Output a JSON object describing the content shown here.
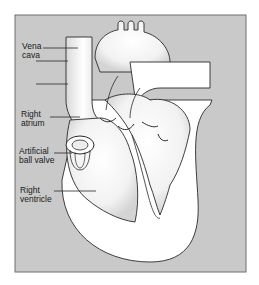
{
  "diagram": {
    "colors": {
      "panel": "#c9c9c9",
      "panel_border": "#6e6e6e",
      "heart_fill": "#ffffff",
      "outline": "#2a2a2a",
      "shade": "#d8d8d8"
    },
    "labels": [
      {
        "id": "vena-cava",
        "lines": [
          "Vena",
          "cava"
        ]
      },
      {
        "id": "right-atrium",
        "lines": [
          "Right",
          "atrium"
        ]
      },
      {
        "id": "artificial-ball-valve",
        "lines": [
          "Artificial",
          "ball valve"
        ]
      },
      {
        "id": "right-ventricle",
        "lines": [
          "Right",
          "ventricle"
        ]
      }
    ]
  }
}
